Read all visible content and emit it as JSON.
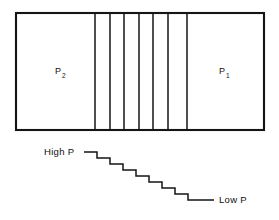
{
  "figure": {
    "background_color": "#ffffff",
    "line_color": "#151515",
    "vessel": {
      "x": 16,
      "y": 13,
      "width": 248,
      "height": 117,
      "stroke_width": 2.1,
      "fill": "#ffffff"
    },
    "partitions": {
      "count": 7,
      "x_positions": [
        95,
        110,
        124,
        139,
        153,
        168,
        187
      ],
      "stroke_width": 1.5
    },
    "chambers": [
      {
        "name": "high-pressure-chamber",
        "base_label": "P",
        "subscript": "2",
        "label_x": 55,
        "label_y": 74,
        "sub_x": 62,
        "sub_y": 78
      },
      {
        "name": "low-pressure-chamber",
        "base_label": "P",
        "subscript": "1",
        "label_x": 219,
        "label_y": 74,
        "sub_x": 226,
        "sub_y": 78
      }
    ],
    "staircase": {
      "name": "pressure-gradient-staircase",
      "step_count": 8,
      "points": "84,152 97,152 97,158 110,158 110,164 123,164 123,170 136,170 136,176 149,176 149,182 162,182 162,188 175,188 175,194 188,194 188,200 214,200",
      "lead_in_start_x": 84,
      "lead_in_y": 152,
      "lead_out_end_x": 214,
      "lead_out_y": 200,
      "stroke_width": 1.5,
      "left_label": "High P",
      "left_label_x": 44,
      "left_label_y": 155,
      "right_label": "Low P",
      "right_label_x": 219,
      "right_label_y": 203
    }
  }
}
